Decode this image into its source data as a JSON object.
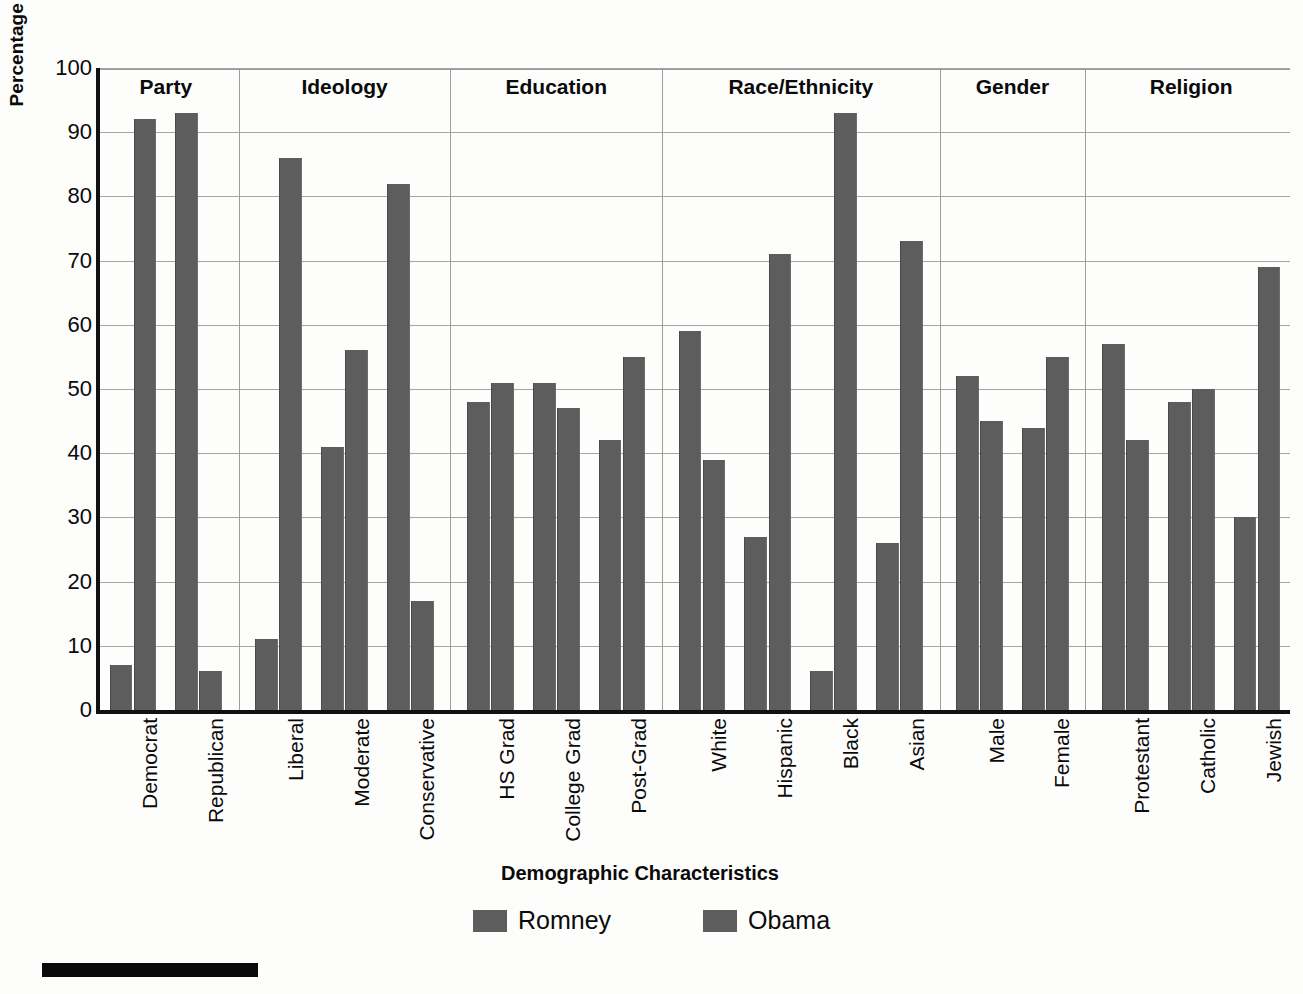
{
  "chart_data": {
    "type": "bar",
    "title": "",
    "xlabel": "Demographic Characteristics",
    "ylabel": "Percentage of Total Votes",
    "ylim": [
      0,
      100
    ],
    "ytick_step": 10,
    "yticks": [
      100,
      90,
      80,
      70,
      60,
      50,
      40,
      30,
      20,
      10,
      0
    ],
    "grid": "horizontal",
    "legend_position": "bottom-center",
    "bar_color": "#5d5d5d",
    "categories": [
      "Democrat",
      "Republican",
      "Liberal",
      "Moderate",
      "Conservative",
      "HS Grad",
      "College Grad",
      "Post-Grad",
      "White",
      "Hispanic",
      "Black",
      "Asian",
      "Male",
      "Female",
      "Protestant",
      "Catholic",
      "Jewish"
    ],
    "series": [
      {
        "name": "Romney",
        "color": "#5d5d5d",
        "values": [
          7,
          93,
          11,
          41,
          82,
          48,
          51,
          42,
          59,
          27,
          6,
          26,
          52,
          44,
          57,
          48,
          30
        ]
      },
      {
        "name": "Obama",
        "color": "#5d5d5d",
        "values": [
          92,
          6,
          86,
          56,
          17,
          51,
          47,
          55,
          39,
          71,
          93,
          73,
          45,
          55,
          42,
          50,
          69
        ]
      }
    ],
    "groups": [
      {
        "label": "Party",
        "categories": [
          "Democrat",
          "Republican"
        ]
      },
      {
        "label": "Ideology",
        "categories": [
          "Liberal",
          "Moderate",
          "Conservative"
        ]
      },
      {
        "label": "Education",
        "categories": [
          "HS Grad",
          "College Grad",
          "Post-Grad"
        ]
      },
      {
        "label": "Race/Ethnicity",
        "categories": [
          "White",
          "Hispanic",
          "Black",
          "Asian"
        ]
      },
      {
        "label": "Gender",
        "categories": [
          "Male",
          "Female"
        ]
      },
      {
        "label": "Religion",
        "categories": [
          "Protestant",
          "Catholic",
          "Jewish"
        ]
      }
    ]
  },
  "legend": {
    "entries": [
      {
        "label": "Romney"
      },
      {
        "label": "Obama"
      }
    ]
  },
  "axes": {
    "x_title": "Demographic Characteristics",
    "y_title": "Percentage of Total Votes"
  }
}
